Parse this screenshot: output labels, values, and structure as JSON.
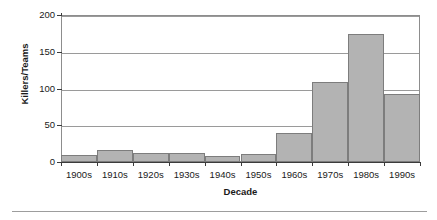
{
  "chart_data": {
    "type": "bar",
    "title": "",
    "xlabel": "Decade",
    "ylabel": "Killers/Teams",
    "categories": [
      "1900s",
      "1910s",
      "1920s",
      "1930s",
      "1940s",
      "1950s",
      "1960s",
      "1970s",
      "1980s",
      "1990s"
    ],
    "values": [
      9,
      16,
      12,
      12,
      8,
      11,
      40,
      109,
      174,
      93
    ],
    "ylim": [
      0,
      200
    ],
    "yticks": [
      0,
      50,
      100,
      150,
      200
    ],
    "ytick_labels": [
      "0",
      "50",
      "100",
      "150",
      "200"
    ],
    "grid": "horizontal",
    "legend": "none",
    "bar_color": "#b3b3b3",
    "bar_border_color": "#7d7d7d",
    "gridline_color": "#9a9a9a",
    "axis_color": "#3b3b3b",
    "plot_border_color": "#8d8d8d",
    "bar_gap": 0
  }
}
